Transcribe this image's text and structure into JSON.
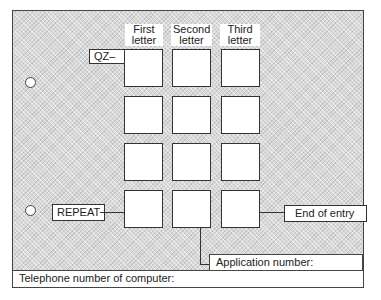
{
  "headers": {
    "first": [
      "First",
      "letter"
    ],
    "second": [
      "Second",
      "letter"
    ],
    "third": [
      "Third",
      "letter"
    ]
  },
  "labels": {
    "prefix": "QZ–",
    "repeat": "REPEAT",
    "end_of_entry": "End of entry",
    "application_number": "Application number:",
    "telephone_number": "Telephone number of computer:"
  },
  "grid": {
    "rows": 4,
    "columns": 3
  }
}
